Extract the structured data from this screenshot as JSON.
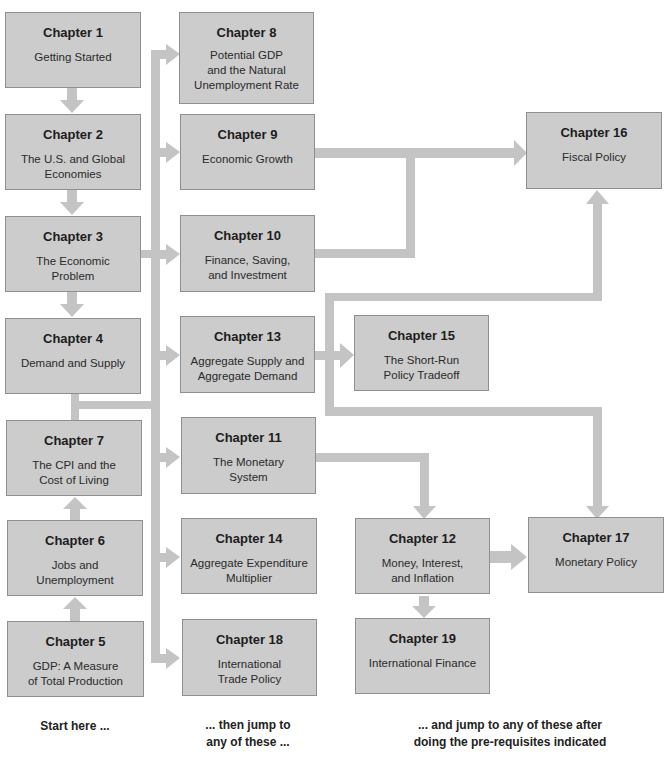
{
  "diagram": {
    "connector_color": "#c4c4c4",
    "box_fill": "#cccccc",
    "box_border": "#8f8f8f",
    "chapters": {
      "ch1": {
        "number": "Chapter 1",
        "title": "Getting Started"
      },
      "ch2": {
        "number": "Chapter 2",
        "title": "The U.S. and Global\nEconomies"
      },
      "ch3": {
        "number": "Chapter 3",
        "title": "The Economic\nProblem"
      },
      "ch4": {
        "number": "Chapter 4",
        "title": "Demand and Supply"
      },
      "ch5": {
        "number": "Chapter 5",
        "title": "GDP: A Measure\nof Total Production"
      },
      "ch6": {
        "number": "Chapter 6",
        "title": "Jobs and\nUnemployment"
      },
      "ch7": {
        "number": "Chapter 7",
        "title": "The CPI and the\nCost of Living"
      },
      "ch8": {
        "number": "Chapter 8",
        "title": "Potential GDP\nand the Natural\nUnemployment Rate"
      },
      "ch9": {
        "number": "Chapter 9",
        "title": "Economic Growth"
      },
      "ch10": {
        "number": "Chapter 10",
        "title": "Finance, Saving,\nand Investment"
      },
      "ch11": {
        "number": "Chapter 11",
        "title": "The Monetary\nSystem"
      },
      "ch12": {
        "number": "Chapter 12",
        "title": "Money, Interest,\nand Inflation"
      },
      "ch13": {
        "number": "Chapter 13",
        "title": "Aggregate Supply and\nAggregate Demand"
      },
      "ch14": {
        "number": "Chapter 14",
        "title": "Aggregate Expenditure\nMultiplier"
      },
      "ch15": {
        "number": "Chapter 15",
        "title": "The Short-Run\nPolicy Tradeoff"
      },
      "ch16": {
        "number": "Chapter 16",
        "title": "Fiscal Policy"
      },
      "ch17": {
        "number": "Chapter 17",
        "title": "Monetary Policy"
      },
      "ch18": {
        "number": "Chapter 18",
        "title": "International\nTrade Policy"
      },
      "ch19": {
        "number": "Chapter 19",
        "title": "International Finance"
      }
    },
    "captions": {
      "start": "Start here ...",
      "then": "... then jump to\nany of these ...",
      "after": "... and jump to any of these after\ndoing the pre-requisites indicated"
    },
    "edges": [
      [
        "ch1",
        "ch2"
      ],
      [
        "ch2",
        "ch3"
      ],
      [
        "ch3",
        "ch4"
      ],
      [
        "ch5",
        "ch6"
      ],
      [
        "ch6",
        "ch7"
      ],
      [
        "core",
        "ch8"
      ],
      [
        "core",
        "ch9"
      ],
      [
        "core",
        "ch10"
      ],
      [
        "core",
        "ch13"
      ],
      [
        "core",
        "ch11"
      ],
      [
        "core",
        "ch14"
      ],
      [
        "core",
        "ch18"
      ],
      [
        "ch9",
        "ch16"
      ],
      [
        "ch10",
        "ch16"
      ],
      [
        "ch13",
        "ch15"
      ],
      [
        "ch13",
        "ch16"
      ],
      [
        "ch13",
        "ch17"
      ],
      [
        "ch11",
        "ch12"
      ],
      [
        "ch12",
        "ch17"
      ],
      [
        "ch12",
        "ch19"
      ]
    ]
  }
}
